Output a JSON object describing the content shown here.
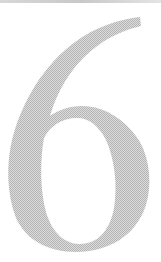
{
  "figure": {
    "glyph": "6",
    "fill_color": "#bdbdbd",
    "background": "#ffffff",
    "top_rule_color": "#cccccc"
  }
}
